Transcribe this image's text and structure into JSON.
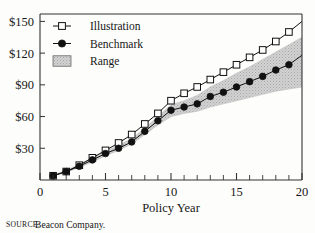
{
  "source_note": {
    "kicker": "SOURCE:",
    "text": "Beacon Company."
  },
  "colors": {
    "line": "#111111",
    "band_fill": "#c9c9c9",
    "band_edge": "#bdbdbd",
    "marker_open_fill": "#ffffff",
    "marker_closed_fill": "#111111",
    "frame": "#333333",
    "background": "#fdfdfb"
  },
  "chart_data": {
    "type": "line",
    "title": "",
    "xlabel": "Policy Year",
    "ylabel": "",
    "xlim": [
      0,
      20
    ],
    "ylim": [
      0,
      157
    ],
    "grid": false,
    "legend_position": "top-left",
    "xticks": [
      0,
      5,
      10,
      15,
      20
    ],
    "xtick_labels": [
      "0",
      "5",
      "10",
      "15",
      "20"
    ],
    "xminor_ticks": [
      1,
      2,
      3,
      4,
      6,
      7,
      8,
      9,
      11,
      12,
      13,
      14,
      16,
      17,
      18,
      19
    ],
    "yticks": [
      30,
      60,
      90,
      120,
      150
    ],
    "ytick_labels": [
      "$30",
      "$60",
      "$90",
      "$120",
      "$150"
    ],
    "x": [
      1,
      2,
      3,
      4,
      5,
      6,
      7,
      8,
      9,
      10,
      11,
      12,
      13,
      14,
      15,
      16,
      17,
      18,
      19,
      20
    ],
    "series": [
      {
        "name": "Illustration",
        "marker": "open-square",
        "values": [
          4,
          8,
          14,
          21,
          28,
          35,
          43,
          53,
          63,
          75,
          82,
          88,
          95,
          102,
          109,
          116,
          123,
          131,
          140,
          150
        ]
      },
      {
        "name": "Benchmark",
        "marker": "filled-circle",
        "values": [
          4,
          8,
          13,
          19,
          25,
          30,
          36,
          46,
          56,
          66,
          69,
          72,
          79,
          83,
          88,
          93,
          98,
          104,
          109,
          118
        ]
      }
    ],
    "band": {
      "name": "Range",
      "marker": "shaded-swatch",
      "lower": [
        4,
        7,
        12,
        17,
        23,
        28,
        34,
        43,
        52,
        60,
        63,
        65,
        69,
        72,
        75,
        78,
        81,
        84,
        86,
        88
      ],
      "upper": [
        5,
        9,
        15,
        21,
        27,
        33,
        39,
        49,
        60,
        71,
        75,
        80,
        88,
        94,
        101,
        107,
        114,
        121,
        128,
        135
      ]
    },
    "legend": [
      {
        "label": "Illustration",
        "marker": "open-square"
      },
      {
        "label": "Benchmark",
        "marker": "filled-circle"
      },
      {
        "label": "Range",
        "marker": "shaded-swatch"
      }
    ]
  }
}
